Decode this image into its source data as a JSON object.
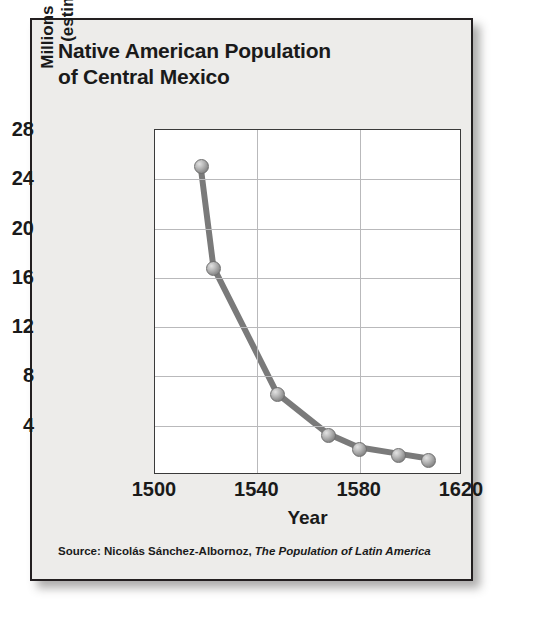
{
  "figure": {
    "title": "Native American Population\nof Central Mexico",
    "source_prefix": "Source: Nicolás Sánchez-Albornoz, ",
    "source_book": "The Population of Latin America",
    "border_color": "#231f20",
    "background_color": "#edecea",
    "plot_background": "#ffffff",
    "grid_color": "#b9b9bb",
    "line_color": "#7a7a7a",
    "marker_color": "#9c9c9c"
  },
  "chart_data": {
    "type": "line",
    "title": "Native American Population of Central Mexico",
    "xlabel": "Year",
    "ylabel": "Millions of People\n(estimated)",
    "xlim": [
      1500,
      1620
    ],
    "ylim": [
      0,
      28
    ],
    "xticks": [
      1500,
      1540,
      1580,
      1620
    ],
    "yticks": [
      4,
      8,
      12,
      16,
      20,
      24,
      28
    ],
    "grid": true,
    "legend": "none",
    "x": [
      1518,
      1523,
      1548,
      1568,
      1580,
      1595,
      1607
    ],
    "values": [
      25.0,
      16.8,
      6.5,
      3.2,
      2.1,
      1.6,
      1.2
    ],
    "points": [
      {
        "year": 1518,
        "population_millions": 25.0
      },
      {
        "year": 1523,
        "population_millions": 16.8
      },
      {
        "year": 1548,
        "population_millions": 6.5
      },
      {
        "year": 1568,
        "population_millions": 3.2
      },
      {
        "year": 1580,
        "population_millions": 2.1
      },
      {
        "year": 1595,
        "population_millions": 1.6
      },
      {
        "year": 1607,
        "population_millions": 1.2
      }
    ]
  }
}
